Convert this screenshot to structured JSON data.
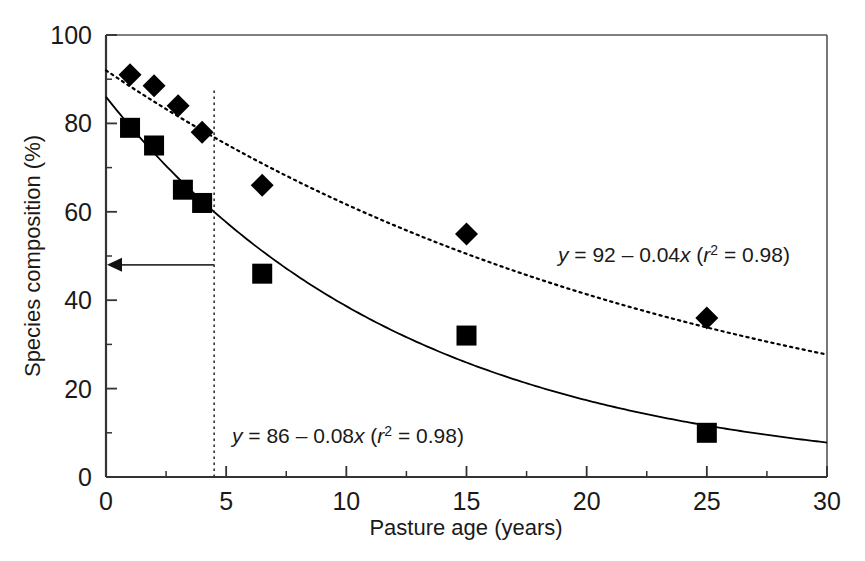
{
  "chart_data": {
    "type": "scatter",
    "title": "",
    "xlabel": "Pasture age (years)",
    "ylabel": "Species composition (%)",
    "xlim": [
      0,
      30
    ],
    "ylim": [
      0,
      100
    ],
    "xticks": [
      0,
      5,
      10,
      15,
      20,
      25,
      30
    ],
    "xticklabels": [
      "0",
      "5",
      "10",
      "15",
      "20",
      "25",
      "30"
    ],
    "xminorticks": [
      2.5,
      7.5,
      12.5,
      17.5,
      22.5,
      27.5
    ],
    "yticks": [
      0,
      20,
      40,
      60,
      80,
      100
    ],
    "yticklabels": [
      "0",
      "20",
      "40",
      "60",
      "80",
      "100"
    ],
    "yminorticks": [
      10,
      30,
      50,
      70,
      90
    ],
    "grid": false,
    "legend": "none",
    "series": [
      {
        "name": "diamond-series",
        "marker": "diamond",
        "color": "#000000",
        "fit_style": "dotted",
        "equation": "y = 92 – 0.04x (r² = 0.98)",
        "equation_parts": {
          "y": "y",
          "eq1": " = 92 – 0.04",
          "x": "x",
          "open": " (",
          "r": "r",
          "sup": "2",
          "eq2": " = 0.98)"
        },
        "fit_intercept": 92,
        "fit_rate": 0.04,
        "r_squared": 0.98,
        "points": [
          {
            "x": 1,
            "y": 91
          },
          {
            "x": 2,
            "y": 88.5
          },
          {
            "x": 3,
            "y": 84
          },
          {
            "x": 4,
            "y": 78
          },
          {
            "x": 6.5,
            "y": 66
          },
          {
            "x": 15,
            "y": 55
          },
          {
            "x": 25,
            "y": 36
          }
        ]
      },
      {
        "name": "square-series",
        "marker": "square",
        "color": "#000000",
        "fit_style": "solid",
        "equation": "y = 86 – 0.08x (r² = 0.98)",
        "equation_parts": {
          "y": "y",
          "eq1": " = 86 – 0.08",
          "x": "x",
          "open": " (",
          "r": "r",
          "sup": "2",
          "eq2": " = 0.98)"
        },
        "fit_intercept": 86,
        "fit_rate": 0.08,
        "r_squared": 0.98,
        "points": [
          {
            "x": 1,
            "y": 79
          },
          {
            "x": 2,
            "y": 75
          },
          {
            "x": 3.2,
            "y": 65
          },
          {
            "x": 4,
            "y": 62
          },
          {
            "x": 6.5,
            "y": 46
          },
          {
            "x": 15,
            "y": 32
          },
          {
            "x": 25,
            "y": 10
          }
        ]
      }
    ],
    "annotations": [
      {
        "name": "reference-vline",
        "type": "vertical-dotted-line",
        "x": 4.5,
        "y_from": 0,
        "y_to": 88
      },
      {
        "name": "reference-arrow",
        "type": "horizontal-arrow",
        "y": 48,
        "x_from": 4.5,
        "x_to": 0,
        "direction": "left"
      }
    ]
  }
}
